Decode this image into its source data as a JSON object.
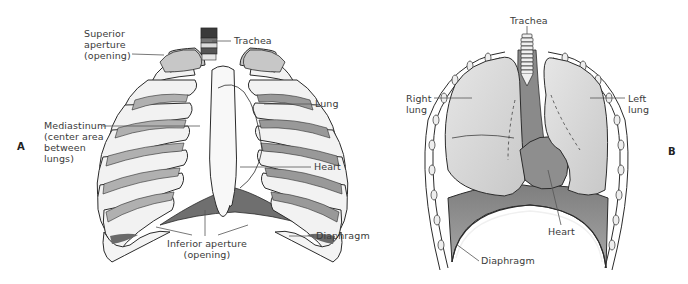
{
  "figure": {
    "panels": [
      {
        "id": "A",
        "letter": "A",
        "title": "Rib cage anterior view",
        "labels": {
          "superior_aperture": "Superior\naperture\n(opening)",
          "trachea": "Trachea",
          "lung": "Lung",
          "mediastinum": "Mediastinum\n(center area\nbetween\nlungs)",
          "heart": "Heart",
          "diaphragm": "Diaphragm",
          "inferior_aperture": "Inferior aperture\n(opening)"
        }
      },
      {
        "id": "B",
        "letter": "B",
        "title": "Thoracic cavity with lungs",
        "labels": {
          "trachea": "Trachea",
          "right_lung": "Right\nlung",
          "left_lung": "Left\nlung",
          "heart": "Heart",
          "diaphragm": "Diaphragm"
        }
      }
    ],
    "colors": {
      "outline": "#2b2b2b",
      "bone": "#f4f4f4",
      "lung_fill": "#d9d9d9",
      "shade_dark": "#8a8a8a",
      "shade_mid": "#b5b5b5",
      "label_text": "#3a3a3a",
      "leader_line": "#555555"
    }
  }
}
